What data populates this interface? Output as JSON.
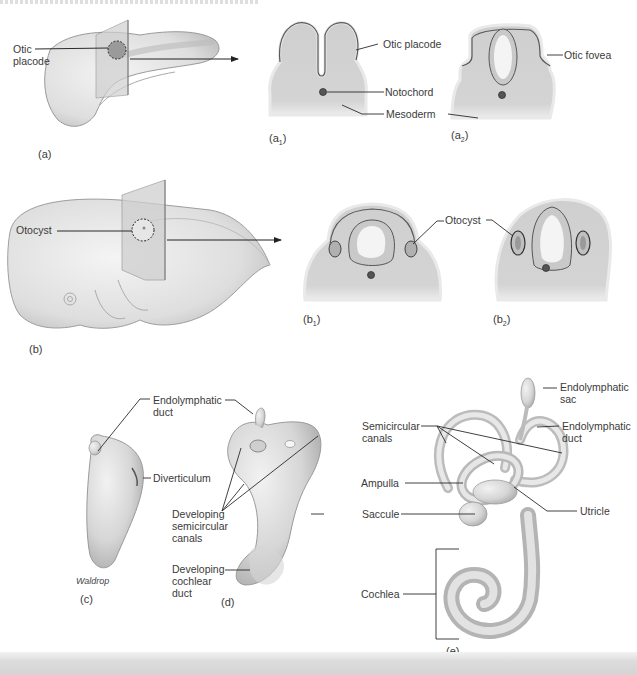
{
  "figure": {
    "title_fragment": "(cut-off caption text at top edge)",
    "credit": "Waldrop",
    "colors": {
      "background": "#ffffff",
      "tissue": "#d2d2d2",
      "tissue_dark": "#a9a9a9",
      "epithelium_line": "#5a5a5a",
      "lumen": "#f5f5f5",
      "notochord": "#555555",
      "leader_line": "#2b2b2b",
      "bottom_band": "#d6d6d6"
    }
  },
  "panels": {
    "a": {
      "caption": "(a)",
      "labels": {
        "otic_placode": "Otic placode"
      }
    },
    "a1": {
      "caption_base": "(a",
      "caption_sub": "1",
      "caption_end": ")",
      "labels": {
        "otic_placode": "Otic placode",
        "notochord": "Notochord",
        "mesoderm": "Mesoderm"
      }
    },
    "a2": {
      "caption_base": "(a",
      "caption_sub": "2",
      "caption_end": ")",
      "labels": {
        "otic_fovea": "Otic fovea"
      }
    },
    "b": {
      "caption": "(b)",
      "labels": {
        "otocyst": "Otocyst"
      }
    },
    "b1": {
      "caption_base": "(b",
      "caption_sub": "1",
      "caption_end": ")",
      "labels": {
        "otocyst": "Otocyst"
      }
    },
    "b2": {
      "caption_base": "(b",
      "caption_sub": "2",
      "caption_end": ")"
    },
    "c": {
      "caption": "(c)",
      "labels": {
        "endolymphatic_duct": "Endolymphatic duct",
        "diverticulum": "Diverticulum"
      }
    },
    "d": {
      "caption": "(d)",
      "labels": {
        "developing_semicircular_canals": "Developing semicircular canals",
        "developing_cochlear_duct": "Developing cochlear duct"
      }
    },
    "e": {
      "caption": "(e)",
      "labels": {
        "endolymphatic_sac": "Endolymphatic sac",
        "semicircular_canals": "Semicircular canals",
        "endolymphatic_duct": "Endolymphatic duct",
        "ampulla": "Ampulla",
        "saccule": "Saccule",
        "utricle": "Utricle",
        "cochlea": "Cochlea"
      }
    }
  }
}
